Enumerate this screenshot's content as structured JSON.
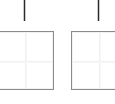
{
  "figure": {
    "title": "",
    "background_color": "#ffffff",
    "frame_border_color": "#8a8a8a",
    "grid_color": "#f0f0f0",
    "marker_color": "#2b2b2b",
    "panel_count": 2
  },
  "panels": [
    {
      "name": "panel-left",
      "label": "",
      "marker_label": "",
      "frame": {
        "x": -6,
        "y": 31,
        "width": 60,
        "height": 59
      },
      "marker": {
        "x": 23,
        "y": 0,
        "width": 3,
        "height": 21
      },
      "crosshair": {
        "x": 24,
        "y": 60
      },
      "clipped_edge": "left"
    },
    {
      "name": "panel-right",
      "label": "",
      "marker_label": "",
      "frame": {
        "x": 71,
        "y": 31,
        "width": 60,
        "height": 59
      },
      "marker": {
        "x": 97,
        "y": 0,
        "width": 3,
        "height": 21
      },
      "crosshair": {
        "x": 98,
        "y": 60
      },
      "clipped_edge": "right"
    }
  ],
  "chart_data": {
    "type": "line",
    "title": "",
    "xlabel": "",
    "ylabel": "",
    "grid": true,
    "legend": "none",
    "note": "Cropped fragment of a multi-panel figure: two empty axes frames, each with a single faint horizontal and vertical gridline forming a crosshair at the panel centre, and a short dark vertical tick marker centred above the frame.",
    "series": [
      {
        "name": "panel-left-marker",
        "x": [
          24
        ],
        "values": [
          1
        ]
      },
      {
        "name": "panel-right-marker",
        "x": [
          98
        ],
        "values": [
          1
        ]
      }
    ],
    "categories": [
      "panel-left",
      "panel-right"
    ],
    "xlim": [
      0,
      115
    ],
    "ylim": [
      0,
      104
    ]
  }
}
